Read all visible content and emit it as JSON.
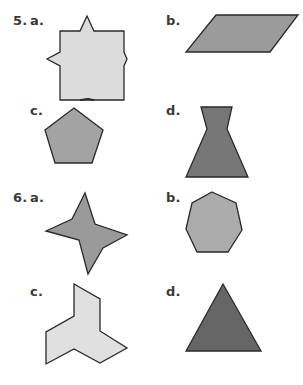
{
  "problems": [
    {
      "number": "5.",
      "items": [
        {
          "label": "a.",
          "shape": "square-with-four-spikes",
          "fill": "#dcdcdc"
        },
        {
          "label": "b.",
          "shape": "parallelogram",
          "fill": "#9b9b9b"
        },
        {
          "label": "c.",
          "shape": "pentagon",
          "fill": "#a3a3a3"
        },
        {
          "label": "d.",
          "shape": "hourglass-trapezoid",
          "fill": "#777777"
        }
      ]
    },
    {
      "number": "6.",
      "items": [
        {
          "label": "a.",
          "shape": "four-point-star",
          "fill": "#9a9a9a"
        },
        {
          "label": "b.",
          "shape": "heptagon",
          "fill": "#ababab"
        },
        {
          "label": "c.",
          "shape": "three-arm-concave-polygon",
          "fill": "#e0e0e0"
        },
        {
          "label": "d.",
          "shape": "triangle",
          "fill": "#666666"
        }
      ]
    }
  ],
  "stroke": "#2a2a2a"
}
